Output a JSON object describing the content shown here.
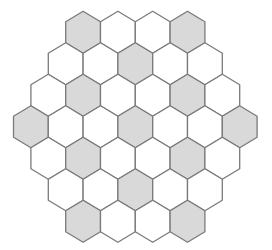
{
  "diagram": {
    "type": "hexagonal-grid",
    "orientation": "pointy-top",
    "row_lengths": [
      4,
      5,
      6,
      7,
      6,
      5,
      4
    ],
    "shaded": [
      [
        0,
        3
      ],
      [
        2
      ],
      [
        1,
        4
      ],
      [
        0,
        3,
        6
      ],
      [
        1,
        4
      ],
      [
        2
      ],
      [
        0,
        3
      ]
    ],
    "colors": {
      "shaded_fill": "#d9d9d9",
      "empty_fill": "#ffffff",
      "stroke": "#7a7a7a"
    }
  }
}
